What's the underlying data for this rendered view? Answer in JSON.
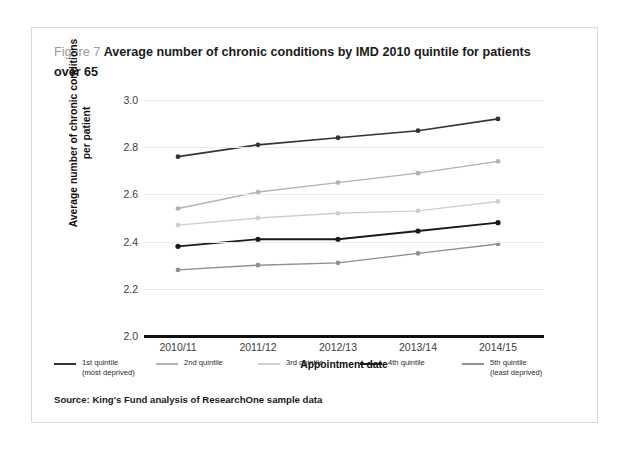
{
  "figure": {
    "label": "Figure 7",
    "title": "Average number of chronic conditions by IMD 2010 quintile for patients over 65",
    "source": "Source: King's Fund analysis of ResearchOne sample data"
  },
  "chart_data": {
    "type": "line",
    "title": "Average number of chronic conditions by IMD 2010 quintile for patients over 65",
    "xlabel": "Appointment date",
    "ylabel": "Average number of chronic conditions per patient",
    "categories": [
      "2010/11",
      "2011/12",
      "2012/13",
      "2013/14",
      "2014/15"
    ],
    "ylim": [
      2.0,
      3.0
    ],
    "yticks": [
      "2.0",
      "2.2",
      "2.4",
      "2.6",
      "2.8",
      "3.0"
    ],
    "ytick_values": [
      2.0,
      2.2,
      2.4,
      2.6,
      2.8,
      3.0
    ],
    "grid": true,
    "legend_position": "bottom",
    "series": [
      {
        "name": "1st quintile",
        "sub": "(most deprived)",
        "color": "#333333",
        "width": 1.6,
        "values": [
          2.76,
          2.81,
          2.84,
          2.87,
          2.92
        ]
      },
      {
        "name": "2nd quintile",
        "sub": "",
        "color": "#b3b3b3",
        "width": 1.4,
        "values": [
          2.54,
          2.61,
          2.65,
          2.69,
          2.74
        ]
      },
      {
        "name": "3rd quintile",
        "sub": "",
        "color": "#cfcfcf",
        "width": 1.4,
        "values": [
          2.47,
          2.5,
          2.52,
          2.53,
          2.57
        ]
      },
      {
        "name": "4th quintile",
        "sub": "",
        "color": "#1a1a1a",
        "width": 1.8,
        "values": [
          2.38,
          2.41,
          2.41,
          2.445,
          2.48
        ]
      },
      {
        "name": "5th quintile",
        "sub": "(least deprived)",
        "color": "#8f8f8f",
        "width": 1.4,
        "values": [
          2.28,
          2.3,
          2.31,
          2.35,
          2.39
        ]
      }
    ]
  }
}
